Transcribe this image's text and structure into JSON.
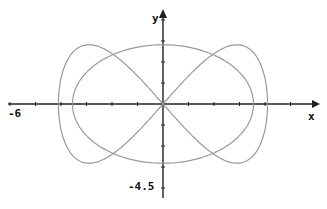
{
  "chart_data": {
    "type": "line",
    "title": "",
    "xlabel": "x",
    "ylabel": "y",
    "xlim": [
      -6,
      6
    ],
    "ylim": [
      -4.5,
      4.5
    ],
    "x_min_label": "-6",
    "y_min_label": "-4.5",
    "grid": false,
    "series": [
      {
        "name": "closed-curve",
        "description": "parametric curve: near-circle of radius ~3.4 combined with figure-eight lobes reaching x ≈ ±4.1, crossing x-axis at ±3.4 and passing through origin",
        "points_sample": [
          [
            0,
            2.8
          ],
          [
            3.0,
            2.8
          ],
          [
            4.1,
            1.4
          ],
          [
            3.4,
            0
          ],
          [
            4.1,
            -1.4
          ],
          [
            3.0,
            -2.8
          ],
          [
            0,
            -2.8
          ],
          [
            -3.0,
            -2.8
          ],
          [
            -4.1,
            -1.4
          ],
          [
            -3.4,
            0
          ],
          [
            -4.1,
            1.4
          ],
          [
            -3.0,
            2.8
          ]
        ]
      }
    ],
    "line_color": "#9a9a9a",
    "axis_color": "#222222"
  },
  "labels": {
    "x": "x",
    "y": "y",
    "xmin": "-6",
    "ymin": "-4.5"
  }
}
